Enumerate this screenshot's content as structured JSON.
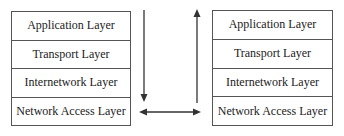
{
  "diagram": {
    "type": "protocol-stack-communication",
    "left_stack": {
      "layers": [
        {
          "label": "Application Layer"
        },
        {
          "label": "Transport Layer"
        },
        {
          "label": "Internetwork Layer"
        },
        {
          "label": "Network Access Layer"
        }
      ]
    },
    "right_stack": {
      "layers": [
        {
          "label": "Application Layer"
        },
        {
          "label": "Transport Layer"
        },
        {
          "label": "Internetwork Layer"
        },
        {
          "label": "Network Access Layer"
        }
      ]
    },
    "arrows": [
      {
        "name": "down-arrow",
        "direction": "down",
        "description": "Data flows down the sending stack"
      },
      {
        "name": "bidirectional-arrow",
        "direction": "left-right",
        "description": "Exchange between network access layers"
      },
      {
        "name": "up-arrow",
        "direction": "up",
        "description": "Data flows up the receiving stack"
      }
    ],
    "colors": {
      "line": "#333333",
      "border": "#555555",
      "text": "#222222",
      "background": "#ffffff"
    }
  }
}
